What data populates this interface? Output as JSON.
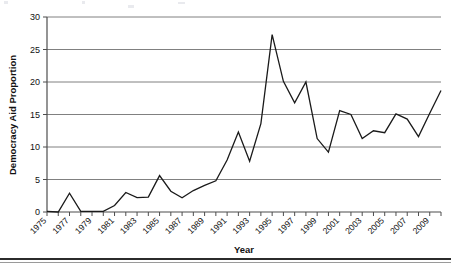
{
  "chart_data": {
    "type": "line",
    "title": "",
    "subtitle": "",
    "xlabel": "Year",
    "ylabel": "Democracy Aid Proportion",
    "xlim": [
      1975,
      2010
    ],
    "ylim": [
      0,
      30
    ],
    "yticks": [
      0,
      5,
      10,
      15,
      20,
      25,
      30
    ],
    "ytick_labels": [
      "0",
      "5",
      "10",
      "15",
      "20",
      "25",
      "30"
    ],
    "xticks": [
      1975,
      1977,
      1979,
      1981,
      1983,
      1985,
      1987,
      1989,
      1991,
      1993,
      1995,
      1997,
      1999,
      2001,
      2003,
      2005,
      2007,
      2009
    ],
    "xtick_labels": [
      "1975",
      "1977",
      "1979",
      "1981",
      "1983",
      "1985",
      "1987",
      "1989",
      "1991",
      "1993",
      "1995",
      "1997",
      "1999",
      "2001",
      "2003",
      "2005",
      "2007",
      "2009"
    ],
    "xtick_rotation": 45,
    "grid": "horizontal",
    "legend": "none",
    "series_color": "#1a1a1a",
    "gridline_color": "#808080",
    "axis_color": "#4d4d4d",
    "x": [
      1975,
      1976,
      1977,
      1978,
      1979,
      1980,
      1981,
      1982,
      1983,
      1984,
      1985,
      1986,
      1987,
      1988,
      1989,
      1990,
      1991,
      1992,
      1993,
      1994,
      1995,
      1996,
      1997,
      1998,
      1999,
      2000,
      2001,
      2002,
      2003,
      2004,
      2005,
      2006,
      2007,
      2008,
      2009,
      2010
    ],
    "series": [
      {
        "name": "Democracy Aid Proportion",
        "values": [
          0.1,
          0.0,
          2.9,
          0.1,
          0.1,
          0.1,
          1.0,
          3.0,
          2.2,
          2.3,
          5.6,
          3.2,
          2.2,
          3.3,
          4.1,
          4.8,
          8.0,
          12.3,
          7.8,
          13.6,
          27.3,
          20.1,
          16.8,
          20.0,
          11.3,
          9.2,
          15.6,
          15.0,
          11.3,
          12.5,
          12.2,
          15.1,
          14.3,
          11.6,
          15.2,
          18.7
        ]
      }
    ],
    "annotations": []
  }
}
